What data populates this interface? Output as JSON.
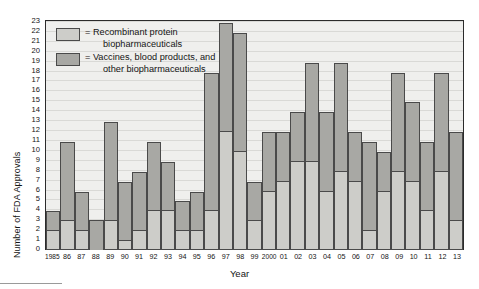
{
  "chart_data": {
    "type": "bar",
    "subtype": "stacked",
    "title": "",
    "xlabel": "Year",
    "ylabel": "Number of FDA Approvals",
    "ylim": [
      0,
      23
    ],
    "ytick_step": 1,
    "grid": true,
    "legend_position": "top-left",
    "categories": [
      "1985",
      "86",
      "87",
      "88",
      "89",
      "90",
      "91",
      "92",
      "93",
      "94",
      "95",
      "96",
      "97",
      "98",
      "99",
      "2000",
      "01",
      "02",
      "03",
      "04",
      "05",
      "06",
      "07",
      "08",
      "09",
      "10",
      "11",
      "12",
      "13"
    ],
    "yticks": [
      "0",
      "1",
      "2",
      "3",
      "4",
      "5",
      "6",
      "7",
      "8",
      "9",
      "10",
      "11",
      "12",
      "13",
      "14",
      "15",
      "16",
      "17",
      "18",
      "19",
      "20",
      "21",
      "22",
      "23"
    ],
    "series": [
      {
        "name": "Recombinant protein biopharmaceuticals",
        "color": "#cdcdc9",
        "values": [
          2,
          3,
          2,
          0,
          3,
          1,
          2,
          4,
          4,
          2,
          2,
          4,
          12,
          10,
          3,
          6,
          7,
          9,
          9,
          6,
          8,
          7,
          2,
          6,
          8,
          7,
          4,
          8,
          3
        ]
      },
      {
        "name": "Vaccines, blood products, and other biopharmaceuticals",
        "color": "#a8a8a4",
        "values": [
          2,
          8,
          4,
          3,
          10,
          6,
          6,
          7,
          5,
          3,
          4,
          14,
          11,
          12,
          4,
          6,
          5,
          5,
          10,
          8,
          11,
          5,
          9,
          4,
          10,
          8,
          7,
          10,
          9
        ]
      }
    ],
    "totals": [
      4,
      11,
      6,
      3,
      13,
      7,
      8,
      11,
      9,
      5,
      6,
      18,
      23,
      22,
      7,
      12,
      12,
      14,
      19,
      14,
      19,
      12,
      11,
      10,
      18,
      15,
      11,
      18,
      12
    ]
  },
  "legend": {
    "entries": [
      {
        "swatch": "light",
        "line1": "= Recombinant protein",
        "line2": "biopharmaceuticals"
      },
      {
        "swatch": "dark",
        "line1": "= Vaccines, blood products, and",
        "line2": "other biopharmaceuticals"
      }
    ]
  },
  "axes": {
    "x_title": "Year",
    "y_title": "Number of FDA Approvals"
  }
}
